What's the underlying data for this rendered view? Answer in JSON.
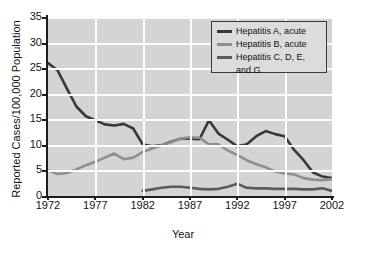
{
  "chart_data": {
    "type": "line",
    "title": "",
    "xlabel": "Year",
    "ylabel": "Reported Cases/100,000 Population",
    "xlim": [
      1972,
      2002
    ],
    "ylim": [
      0,
      35
    ],
    "xticks": [
      "1972",
      "1977",
      "1982",
      "1987",
      "1992",
      "1997",
      "2002"
    ],
    "yticks": [
      "0",
      "5",
      "10",
      "15",
      "20",
      "25",
      "30",
      "35"
    ],
    "grid": true,
    "legend_position": "top-right",
    "background_color": "#d4d4d4",
    "gridline_color": "#fdfdfd",
    "series": [
      {
        "name": "Hepatitis A, acute",
        "color": "#383838",
        "x": [
          1972,
          1973,
          1974,
          1975,
          1976,
          1977,
          1978,
          1979,
          1980,
          1981,
          1982,
          1983,
          1984,
          1985,
          1986,
          1987,
          1988,
          1989,
          1990,
          1991,
          1992,
          1993,
          1994,
          1995,
          1996,
          1997,
          1998,
          1999,
          2000,
          2001,
          2002
        ],
        "values": [
          26.0,
          24.6,
          21.0,
          17.5,
          15.6,
          14.8,
          14.0,
          13.8,
          14.1,
          13.2,
          10.1,
          9.7,
          9.9,
          10.6,
          11.2,
          11.2,
          11.1,
          14.8,
          12.2,
          11.0,
          9.7,
          10.1,
          11.7,
          12.7,
          12.1,
          11.7,
          9.0,
          7.0,
          4.6,
          3.8,
          3.5
        ]
      },
      {
        "name": "Hepatitis B, acute",
        "color": "#8f8f8f",
        "x": [
          1972,
          1973,
          1974,
          1975,
          1976,
          1977,
          1978,
          1979,
          1980,
          1981,
          1982,
          1983,
          1984,
          1985,
          1986,
          1987,
          1988,
          1989,
          1990,
          1991,
          1992,
          1993,
          1994,
          1995,
          1996,
          1997,
          1998,
          1999,
          2000,
          2001,
          2002
        ],
        "values": [
          5.0,
          4.3,
          4.5,
          5.2,
          6.0,
          6.7,
          7.5,
          8.3,
          7.2,
          7.5,
          8.6,
          9.3,
          9.9,
          10.5,
          11.2,
          11.5,
          11.4,
          10.1,
          10.1,
          8.9,
          8.0,
          7.0,
          6.2,
          5.6,
          4.8,
          4.4,
          4.2,
          3.5,
          3.2,
          3.1,
          3.3
        ]
      },
      {
        "name": "Hepatitis C, D, E, and G",
        "color": "#5b5b5b",
        "x": [
          1982,
          1983,
          1984,
          1985,
          1986,
          1987,
          1988,
          1989,
          1990,
          1991,
          1992,
          1993,
          1994,
          1995,
          1996,
          1997,
          1998,
          1999,
          2000,
          2001,
          2002
        ],
        "values": [
          1.0,
          1.3,
          1.6,
          1.8,
          1.8,
          1.6,
          1.4,
          1.3,
          1.4,
          1.8,
          2.4,
          1.6,
          1.5,
          1.5,
          1.4,
          1.4,
          1.4,
          1.3,
          1.3,
          1.5,
          1.0
        ]
      }
    ]
  },
  "legend": {
    "items": [
      {
        "label": "Hepatitis A, acute",
        "color": "#383838"
      },
      {
        "label": "Hepatitis B, acute",
        "color": "#8f8f8f"
      },
      {
        "label": "Hepatitis C, D, E,",
        "label2": "and G",
        "color": "#5b5b5b"
      }
    ]
  },
  "axes": {
    "y_title": "Reported Cases/100,000 Population",
    "x_title": "Year",
    "y_labels": [
      "35",
      "30",
      "25",
      "20",
      "15",
      "10",
      "5",
      "0"
    ],
    "x_labels": [
      "1972",
      "1977",
      "1982",
      "1987",
      "1992",
      "1997",
      "2002"
    ]
  }
}
